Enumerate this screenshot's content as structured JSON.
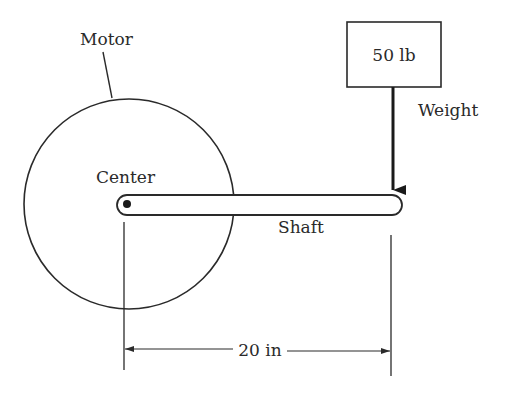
{
  "diagram": {
    "type": "mechanics-torque",
    "labels": {
      "motor": "Motor",
      "center": "Center",
      "shaft": "Shaft",
      "weight_box": "50 lb",
      "weight": "Weight",
      "distance": "20 in"
    },
    "values": {
      "weight_lb": 50,
      "distance_in": 20
    },
    "colors": {
      "line": "#2a2a2a",
      "background": "#ffffff"
    }
  }
}
